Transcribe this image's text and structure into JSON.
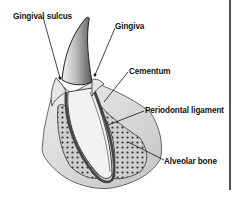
{
  "diagram": {
    "type": "anatomical-illustration",
    "labels": [
      {
        "id": "gingival_sulcus",
        "text": "Gingival sulcus"
      },
      {
        "id": "gingiva",
        "text": "Gingiva"
      },
      {
        "id": "cementum",
        "text": "Cementum"
      },
      {
        "id": "periodontal_ligament",
        "text": "Periodontal ligament"
      },
      {
        "id": "alveolar_bone",
        "text": "Alveolar bone"
      }
    ]
  },
  "colors": {
    "ink": "#111111",
    "enamel_shade": "#6a6a6a",
    "tissue": "#d8d8d8",
    "background": "#ffffff"
  }
}
